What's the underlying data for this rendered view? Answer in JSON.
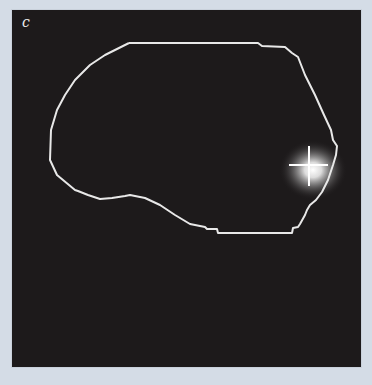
{
  "figure": {
    "panel_label": "c",
    "colors": {
      "background": "#d4dce6",
      "panel": "#1d1a1b",
      "outline": "#e8e8e8",
      "crosshair": "#ffffff",
      "glow": "#ffffff"
    },
    "icons": {
      "marker": "crosshair-icon"
    }
  }
}
